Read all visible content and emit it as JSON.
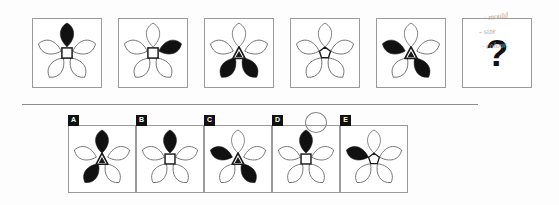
{
  "puzzle": {
    "type": "matrix-reasoning-flower-sequence",
    "question_mark": "?",
    "divider": {
      "x": 22,
      "y": 104,
      "width": 456,
      "height": 1,
      "color": "#8d8d8d"
    }
  },
  "colors": {
    "petal_filled": "#111111",
    "petal_outline": "#6f6f6f",
    "panel_border": "#9a9a9a",
    "tab_bg": "#111111",
    "tab_text": "#ffffff",
    "note_ink": "#a8a8a8",
    "circle_mark": "#8a8a8a"
  },
  "sequence": {
    "panel_box": {
      "y": 18,
      "size": 70,
      "gap": 16,
      "x_start": 32
    },
    "panels": [
      {
        "id": "seq-1",
        "x": 32,
        "center_shape": "square",
        "filled_petals": [
          "top"
        ],
        "petals": [
          "top",
          "upper-left",
          "upper-right",
          "lower-left",
          "lower-right"
        ]
      },
      {
        "id": "seq-2",
        "x": 118,
        "center_shape": "square",
        "filled_petals": [
          "upper-right"
        ],
        "petals": [
          "top",
          "upper-left",
          "upper-right",
          "lower-left",
          "lower-right"
        ]
      },
      {
        "id": "seq-3",
        "x": 204,
        "center_shape": "triangle",
        "filled_petals": [
          "lower-left",
          "lower-right"
        ],
        "petals": [
          "top",
          "upper-left",
          "upper-right",
          "lower-left",
          "lower-right"
        ]
      },
      {
        "id": "seq-4",
        "x": 290,
        "center_shape": "pentagon",
        "filled_petals": [],
        "petals": [
          "top",
          "upper-left",
          "upper-right",
          "lower-left",
          "lower-right"
        ]
      },
      {
        "id": "seq-5",
        "x": 376,
        "center_shape": "triangle",
        "filled_petals": [
          "upper-left",
          "lower-right"
        ],
        "petals": [
          "top",
          "upper-left",
          "upper-right",
          "lower-left",
          "lower-right"
        ]
      },
      {
        "id": "seq-6-question",
        "x": 462,
        "center_shape": "none",
        "filled_petals": [],
        "is_question": true,
        "petals": []
      }
    ]
  },
  "options": {
    "panel_box": {
      "y": 125,
      "size": 68,
      "x_start": 68,
      "gap": 12
    },
    "selected": "D",
    "items": [
      {
        "label": "A",
        "x": 68,
        "center_shape": "triangle",
        "filled_petals": [
          "top",
          "lower-left"
        ]
      },
      {
        "label": "B",
        "x": 136,
        "center_shape": "square",
        "filled_petals": [
          "top"
        ]
      },
      {
        "label": "C",
        "x": 204,
        "center_shape": "triangle",
        "filled_petals": [
          "upper-left",
          "lower-right"
        ]
      },
      {
        "label": "D",
        "x": 272,
        "center_shape": "square",
        "filled_petals": [
          "top"
        ]
      },
      {
        "label": "E",
        "x": 340,
        "center_shape": "pentagon",
        "filled_petals": [
          "upper-left"
        ]
      }
    ]
  },
  "annotations": {
    "handwritten_notes": [
      {
        "text": "· mould",
        "x": 484,
        "y": 12,
        "size": 8,
        "rotate": -8
      },
      {
        "text": "- size",
        "x": 479,
        "y": 27,
        "size": 8,
        "rotate": -6
      },
      {
        "text": "· colour.",
        "x": 482,
        "y": 41,
        "size": 8,
        "rotate": -4
      }
    ],
    "selected_circle": {
      "x": 305,
      "y": 112,
      "width": 20,
      "height": 19
    }
  }
}
